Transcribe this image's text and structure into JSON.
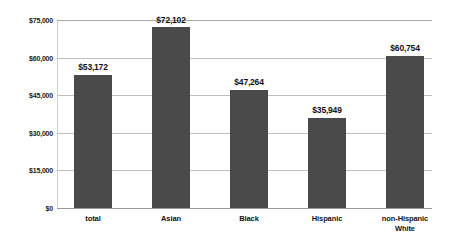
{
  "chart_data": {
    "type": "bar",
    "title": "",
    "subtitle": "",
    "xlabel": "",
    "ylabel": "",
    "categories": [
      "total",
      "Asian",
      "Black",
      "Hispanic",
      "non-Hispanic White"
    ],
    "category_lines": [
      [
        "total"
      ],
      [
        "Asian"
      ],
      [
        "Black"
      ],
      [
        "Hispanic"
      ],
      [
        "non-Hispanic",
        "White"
      ]
    ],
    "values": [
      53172,
      72102,
      47264,
      35949,
      60754
    ],
    "value_labels": [
      "$53,172",
      "$72,102",
      "$47,264",
      "$35,949",
      "$60,754"
    ],
    "ylim": [
      0,
      75000
    ],
    "yticks": [
      0,
      15000,
      30000,
      45000,
      60000,
      75000
    ],
    "ytick_labels": [
      "$0",
      "$15,000",
      "$30,000",
      "$45,000",
      "$60,000",
      "$75,000"
    ],
    "grid": true,
    "legend": false,
    "legend_position": "none",
    "colors": {
      "bar": "#4a4a4a",
      "gridline": "#bfbfbf",
      "baseline": "#9a9a9a",
      "text": "#111111",
      "background": "#ffffff"
    }
  }
}
